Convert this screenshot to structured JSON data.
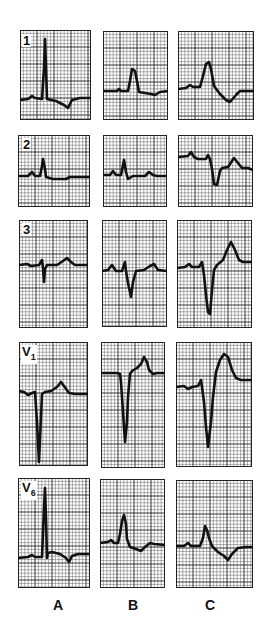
{
  "figure": {
    "columns": [
      {
        "id": "A",
        "label": "A"
      },
      {
        "id": "B",
        "label": "B"
      },
      {
        "id": "C",
        "label": "C"
      }
    ],
    "leads": [
      {
        "id": "1",
        "label": "1"
      },
      {
        "id": "2",
        "label": "2"
      },
      {
        "id": "3",
        "label": "3"
      },
      {
        "id": "V1",
        "label": "V1"
      },
      {
        "id": "V6",
        "label": "V6"
      }
    ],
    "colors": {
      "grid": "#222222",
      "trace": "#111111",
      "background": "#ffffff"
    }
  },
  "panels": [
    {
      "lead": "1",
      "col": "A",
      "x": 20,
      "y": 30,
      "w": 71,
      "h": 90,
      "baseline": 68,
      "trace": [
        [
          0,
          70
        ],
        [
          8,
          69
        ],
        [
          12,
          66
        ],
        [
          15,
          68
        ],
        [
          22,
          69
        ],
        [
          24,
          38
        ],
        [
          25,
          9
        ],
        [
          26,
          38
        ],
        [
          27,
          69
        ],
        [
          36,
          71
        ],
        [
          44,
          75
        ],
        [
          48,
          78
        ],
        [
          52,
          70
        ],
        [
          60,
          68
        ],
        [
          71,
          68
        ]
      ]
    },
    {
      "lead": "1",
      "col": "B",
      "x": 103,
      "y": 31,
      "w": 65,
      "h": 89,
      "baseline": 60,
      "trace": [
        [
          0,
          60
        ],
        [
          14,
          60
        ],
        [
          16,
          58
        ],
        [
          18,
          60
        ],
        [
          25,
          60
        ],
        [
          27,
          50
        ],
        [
          29,
          38
        ],
        [
          32,
          40
        ],
        [
          34,
          50
        ],
        [
          36,
          61
        ],
        [
          42,
          62
        ],
        [
          48,
          63
        ],
        [
          52,
          64
        ],
        [
          57,
          61
        ],
        [
          65,
          60
        ]
      ]
    },
    {
      "lead": "1",
      "col": "C",
      "x": 178,
      "y": 31,
      "w": 76,
      "h": 89,
      "baseline": 58,
      "trace": [
        [
          0,
          58
        ],
        [
          8,
          57
        ],
        [
          12,
          54
        ],
        [
          15,
          56
        ],
        [
          22,
          56
        ],
        [
          25,
          45
        ],
        [
          28,
          33
        ],
        [
          31,
          31
        ],
        [
          33,
          38
        ],
        [
          36,
          55
        ],
        [
          42,
          63
        ],
        [
          48,
          69
        ],
        [
          52,
          71
        ],
        [
          58,
          64
        ],
        [
          62,
          60
        ],
        [
          76,
          60
        ]
      ]
    },
    {
      "lead": "2",
      "col": "A",
      "x": 18,
      "y": 135,
      "w": 72,
      "h": 72,
      "baseline": 40,
      "trace": [
        [
          0,
          41
        ],
        [
          10,
          41
        ],
        [
          14,
          37
        ],
        [
          17,
          41
        ],
        [
          22,
          41
        ],
        [
          24,
          31
        ],
        [
          25,
          24
        ],
        [
          27,
          34
        ],
        [
          28,
          42
        ],
        [
          35,
          44
        ],
        [
          48,
          44
        ],
        [
          52,
          42
        ],
        [
          72,
          42
        ]
      ]
    },
    {
      "lead": "2",
      "col": "B",
      "x": 103,
      "y": 135,
      "w": 64,
      "h": 72,
      "baseline": 40,
      "trace": [
        [
          0,
          40
        ],
        [
          7,
          40
        ],
        [
          10,
          36
        ],
        [
          13,
          40
        ],
        [
          18,
          40
        ],
        [
          21,
          25
        ],
        [
          23,
          37
        ],
        [
          25,
          44
        ],
        [
          30,
          41
        ],
        [
          42,
          41
        ],
        [
          46,
          37
        ],
        [
          50,
          40
        ],
        [
          54,
          41
        ],
        [
          64,
          41
        ]
      ]
    },
    {
      "lead": "2",
      "col": "C",
      "x": 178,
      "y": 135,
      "w": 75,
      "h": 72,
      "baseline": 22,
      "trace": [
        [
          0,
          22
        ],
        [
          10,
          21
        ],
        [
          13,
          17
        ],
        [
          16,
          22
        ],
        [
          20,
          24
        ],
        [
          28,
          24
        ],
        [
          30,
          20
        ],
        [
          32,
          24
        ],
        [
          34,
          34
        ],
        [
          36,
          49
        ],
        [
          39,
          50
        ],
        [
          42,
          36
        ],
        [
          44,
          33
        ],
        [
          50,
          32
        ],
        [
          56,
          23
        ],
        [
          60,
          28
        ],
        [
          64,
          33
        ],
        [
          70,
          33
        ],
        [
          75,
          35
        ]
      ]
    },
    {
      "lead": "3",
      "col": "A",
      "x": 19,
      "y": 220,
      "w": 69,
      "h": 108,
      "baseline": 44,
      "trace": [
        [
          0,
          45
        ],
        [
          8,
          44
        ],
        [
          12,
          46
        ],
        [
          20,
          45
        ],
        [
          23,
          40
        ],
        [
          24,
          48
        ],
        [
          25,
          62
        ],
        [
          26,
          49
        ],
        [
          28,
          45
        ],
        [
          38,
          45
        ],
        [
          44,
          41
        ],
        [
          48,
          38
        ],
        [
          52,
          42
        ],
        [
          56,
          45
        ],
        [
          69,
          45
        ]
      ]
    },
    {
      "lead": "3",
      "col": "B",
      "x": 102,
      "y": 220,
      "w": 65,
      "h": 107,
      "baseline": 50,
      "trace": [
        [
          0,
          51
        ],
        [
          6,
          50
        ],
        [
          10,
          45
        ],
        [
          14,
          51
        ],
        [
          20,
          51
        ],
        [
          23,
          42
        ],
        [
          24,
          51
        ],
        [
          26,
          63
        ],
        [
          29,
          77
        ],
        [
          31,
          62
        ],
        [
          34,
          51
        ],
        [
          42,
          50
        ],
        [
          48,
          46
        ],
        [
          52,
          44
        ],
        [
          56,
          50
        ],
        [
          65,
          51
        ]
      ]
    },
    {
      "lead": "3",
      "col": "C",
      "x": 177,
      "y": 220,
      "w": 75,
      "h": 108,
      "baseline": 47,
      "trace": [
        [
          0,
          48
        ],
        [
          8,
          47
        ],
        [
          12,
          44
        ],
        [
          15,
          47
        ],
        [
          22,
          47
        ],
        [
          25,
          42
        ],
        [
          27,
          55
        ],
        [
          29,
          75
        ],
        [
          31,
          92
        ],
        [
          33,
          94
        ],
        [
          35,
          70
        ],
        [
          37,
          50
        ],
        [
          40,
          45
        ],
        [
          46,
          40
        ],
        [
          50,
          30
        ],
        [
          54,
          22
        ],
        [
          58,
          30
        ],
        [
          62,
          40
        ],
        [
          66,
          42
        ],
        [
          75,
          42
        ]
      ]
    },
    {
      "lead": "V1",
      "col": "A",
      "x": 19,
      "y": 342,
      "w": 69,
      "h": 124,
      "baseline": 50,
      "trace": [
        [
          0,
          49
        ],
        [
          5,
          50
        ],
        [
          9,
          53
        ],
        [
          13,
          51
        ],
        [
          16,
          50
        ],
        [
          18,
          80
        ],
        [
          20,
          120
        ],
        [
          22,
          75
        ],
        [
          23,
          52
        ],
        [
          26,
          50
        ],
        [
          32,
          49
        ],
        [
          38,
          45
        ],
        [
          42,
          40
        ],
        [
          45,
          44
        ],
        [
          50,
          51
        ],
        [
          56,
          52
        ],
        [
          69,
          52
        ]
      ]
    },
    {
      "lead": "V1",
      "col": "B",
      "x": 101,
      "y": 342,
      "w": 64,
      "h": 126,
      "baseline": 31,
      "trace": [
        [
          0,
          31
        ],
        [
          16,
          31
        ],
        [
          19,
          32
        ],
        [
          20,
          40
        ],
        [
          22,
          70
        ],
        [
          24,
          100
        ],
        [
          26,
          80
        ],
        [
          27,
          55
        ],
        [
          29,
          32
        ],
        [
          31,
          29
        ],
        [
          36,
          26
        ],
        [
          40,
          22
        ],
        [
          43,
          15
        ],
        [
          46,
          20
        ],
        [
          48,
          28
        ],
        [
          52,
          32
        ],
        [
          56,
          31
        ],
        [
          64,
          31
        ]
      ]
    },
    {
      "lead": "V1",
      "col": "C",
      "x": 176,
      "y": 342,
      "w": 76,
      "h": 125,
      "baseline": 45,
      "trace": [
        [
          0,
          45
        ],
        [
          8,
          44
        ],
        [
          12,
          47
        ],
        [
          16,
          45
        ],
        [
          22,
          44
        ],
        [
          25,
          38
        ],
        [
          26,
          45
        ],
        [
          28,
          60
        ],
        [
          30,
          85
        ],
        [
          32,
          105
        ],
        [
          35,
          80
        ],
        [
          37,
          55
        ],
        [
          40,
          30
        ],
        [
          44,
          18
        ],
        [
          48,
          12
        ],
        [
          52,
          15
        ],
        [
          56,
          28
        ],
        [
          60,
          36
        ],
        [
          65,
          38
        ],
        [
          76,
          38
        ]
      ]
    },
    {
      "lead": "V6",
      "col": "A",
      "x": 18,
      "y": 478,
      "w": 72,
      "h": 110,
      "baseline": 78,
      "trace": [
        [
          0,
          80
        ],
        [
          10,
          79
        ],
        [
          14,
          77
        ],
        [
          17,
          79
        ],
        [
          24,
          79
        ],
        [
          26,
          30
        ],
        [
          27,
          10
        ],
        [
          28,
          40
        ],
        [
          29,
          80
        ],
        [
          30,
          75
        ],
        [
          34,
          74
        ],
        [
          42,
          76
        ],
        [
          48,
          80
        ],
        [
          51,
          84
        ],
        [
          54,
          78
        ],
        [
          60,
          76
        ],
        [
          72,
          76
        ]
      ]
    },
    {
      "lead": "V6",
      "col": "B",
      "x": 100,
      "y": 479,
      "w": 65,
      "h": 109,
      "baseline": 64,
      "trace": [
        [
          0,
          64
        ],
        [
          8,
          63
        ],
        [
          11,
          61
        ],
        [
          14,
          64
        ],
        [
          18,
          64
        ],
        [
          20,
          55
        ],
        [
          22,
          42
        ],
        [
          24,
          36
        ],
        [
          26,
          45
        ],
        [
          27,
          60
        ],
        [
          30,
          68
        ],
        [
          36,
          70
        ],
        [
          41,
          72
        ],
        [
          45,
          68
        ],
        [
          50,
          64
        ],
        [
          54,
          65
        ],
        [
          65,
          66
        ]
      ]
    },
    {
      "lead": "V6",
      "col": "C",
      "x": 176,
      "y": 480,
      "w": 77,
      "h": 108,
      "baseline": 66,
      "trace": [
        [
          0,
          66
        ],
        [
          8,
          66
        ],
        [
          12,
          63
        ],
        [
          15,
          66
        ],
        [
          24,
          66
        ],
        [
          27,
          58
        ],
        [
          29,
          46
        ],
        [
          31,
          50
        ],
        [
          33,
          58
        ],
        [
          36,
          66
        ],
        [
          42,
          72
        ],
        [
          48,
          76
        ],
        [
          52,
          80
        ],
        [
          56,
          74
        ],
        [
          62,
          68
        ],
        [
          70,
          67
        ],
        [
          77,
          67
        ]
      ]
    }
  ],
  "lead_label_positions": {
    "1": {
      "x": 22,
      "y": 34
    },
    "2": {
      "x": 22,
      "y": 138
    },
    "3": {
      "x": 22,
      "y": 223
    },
    "V1": {
      "x": 21,
      "y": 345
    },
    "V6": {
      "x": 21,
      "y": 481
    }
  },
  "column_label_positions": {
    "A": 48,
    "B": 123,
    "C": 200
  }
}
